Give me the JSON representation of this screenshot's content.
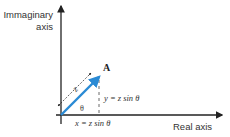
{
  "diagram": {
    "axes": {
      "y_label_line1": "Immaginary",
      "y_label_line2": "axis",
      "x_label": "Real axis"
    },
    "point_label": "A",
    "magnitude_label": "z",
    "angle_label": "θ",
    "y_component": "y = z sin θ",
    "x_component": "x = z sin θ",
    "colors": {
      "vector": "#2a8ad4",
      "axes": "#222222",
      "text": "#333333"
    }
  }
}
